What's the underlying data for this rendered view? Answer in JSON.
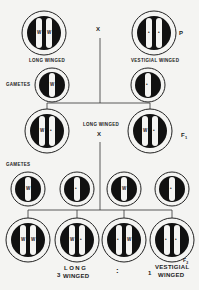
{
  "colors": {
    "ink": "#111111",
    "paper": "#f4f4f2",
    "chromosome": "#f4f4f2"
  },
  "cross_symbol": "X",
  "parents": {
    "generation_label": "P",
    "left": {
      "label": "LONG WINGED",
      "alleles": [
        "W",
        "W"
      ]
    },
    "right": {
      "label": "VESTIGIAL WINGED",
      "alleles": [
        "•",
        "•"
      ]
    }
  },
  "parent_gametes": {
    "label": "GAMETES",
    "items": [
      {
        "allele": "W"
      },
      {
        "allele": "•"
      }
    ]
  },
  "f1": {
    "generation_label": "F",
    "generation_sub": "1",
    "phenotype": "LONG WINGED",
    "left": {
      "alleles": [
        "W",
        "•"
      ]
    },
    "right": {
      "alleles": [
        "W",
        "•"
      ]
    }
  },
  "f1_gametes": {
    "label": "GAMETES",
    "items": [
      {
        "allele": "W"
      },
      {
        "allele": "•"
      },
      {
        "allele": "W"
      },
      {
        "allele": "•"
      }
    ]
  },
  "f2": {
    "generation_label": "F",
    "generation_sub": "2",
    "offspring": [
      {
        "alleles": [
          "W",
          "W"
        ]
      },
      {
        "alleles": [
          "W",
          "•"
        ]
      },
      {
        "alleles": [
          "•",
          "W"
        ]
      },
      {
        "alleles": [
          "•",
          "•"
        ]
      }
    ],
    "ratio": {
      "long_count": "3",
      "long_line1": "LONG",
      "long_line2": "WINGED",
      "separator": ":",
      "vestigial_count": "1",
      "vestigial_line1": "VESTIGIAL",
      "vestigial_line2": "WINGED"
    }
  }
}
